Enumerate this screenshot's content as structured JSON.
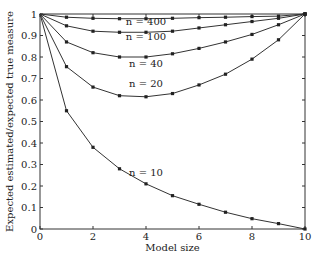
{
  "chart_data": {
    "type": "line",
    "title": "",
    "xlabel": "Model size",
    "ylabel": "Expected estimated/expected true measure",
    "xlim": [
      0,
      10
    ],
    "ylim": [
      0,
      1
    ],
    "grid": false,
    "legend_position": "inline labels",
    "x": [
      0,
      1,
      2,
      3,
      4,
      5,
      6,
      7,
      8,
      9,
      10
    ],
    "x_ticks": [
      "0",
      "2",
      "4",
      "6",
      "8",
      "10"
    ],
    "x_tick_values": [
      0,
      2,
      4,
      6,
      8,
      10
    ],
    "y_ticks": [
      "0",
      "0.1",
      "0.2",
      "0.3",
      "0.4",
      "0.5",
      "0.6",
      "0.7",
      "0.8",
      "0.9",
      "1"
    ],
    "y_tick_values": [
      0,
      0.1,
      0.2,
      0.3,
      0.4,
      0.5,
      0.6,
      0.7,
      0.8,
      0.9,
      1.0
    ],
    "series": [
      {
        "name": "n = 400",
        "values": [
          1,
          0.985,
          0.98,
          0.978,
          0.978,
          0.98,
          0.983,
          0.985,
          0.988,
          0.99,
          1
        ],
        "label_x": 4.0,
        "label_y": 0.95
      },
      {
        "name": "n = 100",
        "values": [
          1,
          0.945,
          0.92,
          0.915,
          0.915,
          0.92,
          0.935,
          0.95,
          0.965,
          0.98,
          1
        ],
        "label_x": 4.0,
        "label_y": 0.88
      },
      {
        "name": "n = 40",
        "values": [
          1,
          0.87,
          0.82,
          0.8,
          0.8,
          0.815,
          0.84,
          0.87,
          0.905,
          0.95,
          1
        ],
        "label_x": 4.0,
        "label_y": 0.755
      },
      {
        "name": "n = 20",
        "values": [
          1,
          0.755,
          0.66,
          0.62,
          0.615,
          0.63,
          0.67,
          0.72,
          0.79,
          0.88,
          1
        ],
        "label_x": 4.0,
        "label_y": 0.66
      },
      {
        "name": "n = 10",
        "values": [
          1,
          0.55,
          0.38,
          0.28,
          0.21,
          0.155,
          0.115,
          0.078,
          0.048,
          0.025,
          0
        ],
        "label_x": 4.0,
        "label_y": 0.245
      }
    ]
  },
  "plot_area": {
    "left": 40,
    "top": 14,
    "right": 305,
    "bottom": 229
  }
}
